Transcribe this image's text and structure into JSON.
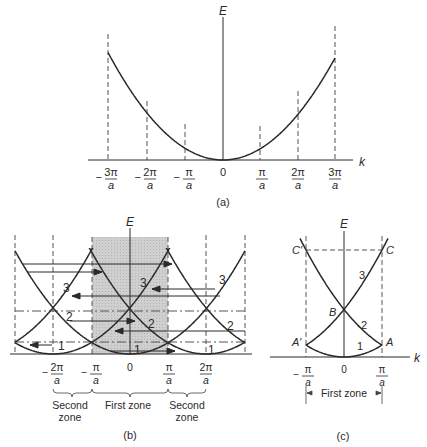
{
  "figure": {
    "panels": [
      {
        "id": "a",
        "caption": "(a)",
        "axis_e_label": "E",
        "axis_k_label": "k",
        "ticks": [
          {
            "sign": "−",
            "num": "3π",
            "den": "a"
          },
          {
            "sign": "−",
            "num": "2π",
            "den": "a"
          },
          {
            "sign": "−",
            "num": "π",
            "den": "a"
          },
          {
            "sign": "",
            "num": "0",
            "den": ""
          },
          {
            "sign": "",
            "num": "π",
            "den": "a"
          },
          {
            "sign": "",
            "num": "2π",
            "den": "a"
          },
          {
            "sign": "",
            "num": "3π",
            "den": "a"
          }
        ],
        "description": "Free-electron parabola E(k) in the extended zone scheme"
      },
      {
        "id": "b",
        "caption": "(b)",
        "axis_e_label": "E",
        "ticks": [
          {
            "sign": "−",
            "num": "2π",
            "den": "a"
          },
          {
            "sign": "−",
            "num": "π",
            "den": "a"
          },
          {
            "sign": "",
            "num": "0",
            "den": ""
          },
          {
            "sign": "",
            "num": "π",
            "den": "a"
          },
          {
            "sign": "",
            "num": "2π",
            "den": "a"
          }
        ],
        "band_labels": [
          "1",
          "2",
          "3"
        ],
        "zones": [
          {
            "line1": "Second",
            "line2": "zone"
          },
          {
            "line1": "First zone",
            "line2": ""
          },
          {
            "line1": "Second",
            "line2": "zone"
          }
        ],
        "shaded_region": "First zone",
        "shade_color": "#c8c8c8",
        "description": "Periodic (repeated) zone scheme with arrows translating branches into the first zone"
      },
      {
        "id": "c",
        "caption": "(c)",
        "axis_e_label": "E",
        "axis_k_label": "k",
        "ticks": [
          {
            "sign": "−",
            "num": "π",
            "den": "a"
          },
          {
            "sign": "",
            "num": "0",
            "den": ""
          },
          {
            "sign": "",
            "num": "π",
            "den": "a"
          }
        ],
        "points": {
          "A": "A",
          "A_prime": "A′",
          "B": "B",
          "C": "C",
          "C_prime": "C′"
        },
        "band_labels": [
          "1",
          "2",
          "3"
        ],
        "zone_label": "First zone",
        "description": "Reduced zone scheme"
      }
    ],
    "colors": {
      "line": "#2a2a2a",
      "dash": "#555555",
      "shade": "#c8c8c8",
      "background": "#ffffff"
    }
  }
}
